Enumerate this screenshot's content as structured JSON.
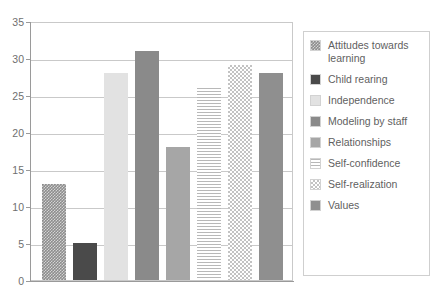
{
  "chart_data": {
    "type": "bar",
    "title": "",
    "subtitle": "",
    "xlabel": "",
    "ylabel": "",
    "ylim": [
      0,
      35
    ],
    "ytick_step": 5,
    "yticks": [
      "0",
      "5",
      "10",
      "15",
      "20",
      "25",
      "30",
      "35"
    ],
    "grid": true,
    "xtick_labels": [],
    "legend_position": "right",
    "categories": [
      "Attitudes towards learning",
      "Child rearing",
      "Independence",
      "Modeling by staff",
      "Relationships",
      "Self-confidence",
      "Self-realization",
      "Values"
    ],
    "values": [
      13,
      5,
      28,
      31,
      18,
      26,
      29,
      28
    ],
    "series": [
      {
        "name": "",
        "values": [
          13,
          5,
          28,
          31,
          18,
          26,
          29,
          28
        ]
      }
    ],
    "bars": [
      {
        "label": "Attitudes towards learning",
        "value": 13,
        "fill": "crosshatch-dark",
        "color": "#8d8d8d"
      },
      {
        "label": "Child rearing",
        "value": 5,
        "fill": "solid-verydark",
        "color": "#4a4a4a"
      },
      {
        "label": "Independence",
        "value": 28,
        "fill": "solid-verylight",
        "color": "#e2e2e2"
      },
      {
        "label": "Modeling by staff",
        "value": 31,
        "fill": "solid-dark",
        "color": "#8a8a8a"
      },
      {
        "label": "Relationships",
        "value": 18,
        "fill": "solid-medium",
        "color": "#a6a6a6"
      },
      {
        "label": "Self-confidence",
        "value": 26,
        "fill": "horizontal-stripe",
        "color": "#b8b8b8"
      },
      {
        "label": "Self-realization",
        "value": 29,
        "fill": "checker",
        "color": "#c3c3c3"
      },
      {
        "label": "Values",
        "value": 28,
        "fill": "solid-values",
        "color": "#8f8f8f"
      }
    ]
  },
  "legend": {
    "items": [
      {
        "label": "Attitudes towards learning",
        "fill": "crosshatch-dark"
      },
      {
        "label": "Child rearing",
        "fill": "solid-verydark"
      },
      {
        "label": "Independence",
        "fill": "solid-verylight"
      },
      {
        "label": "Modeling by staff",
        "fill": "solid-dark"
      },
      {
        "label": "Relationships",
        "fill": "solid-medium"
      },
      {
        "label": "Self-confidence",
        "fill": "horizontal-stripe"
      },
      {
        "label": "Self-realization",
        "fill": "checker"
      },
      {
        "label": "Values",
        "fill": "solid-values"
      }
    ]
  },
  "axis": {
    "y_tick_labels": [
      "35",
      "30",
      "25",
      "20",
      "15",
      "10",
      "5",
      "0"
    ]
  },
  "colors": {
    "gridline": "#c9c9c9",
    "axis": "#9a9a9a",
    "text": "#6f6f6f",
    "legend_border": "#cfcfcf",
    "background": "#ffffff"
  }
}
